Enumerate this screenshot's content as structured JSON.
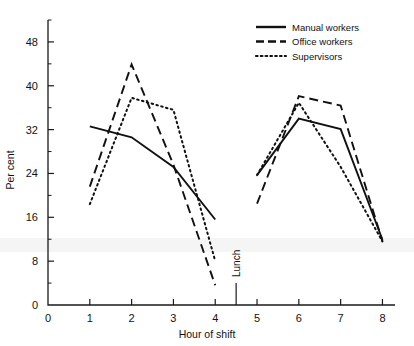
{
  "chart_data": {
    "type": "line",
    "title": "",
    "xlabel": "Hour of shift",
    "ylabel": "Per cent",
    "xlim": [
      0,
      8.3
    ],
    "ylim": [
      0,
      52
    ],
    "grid": false,
    "legend_position": "top-right",
    "x_ticks": [
      "0",
      "1",
      "2",
      "3",
      "4",
      "5",
      "6",
      "7",
      "8"
    ],
    "x_tick_values": [
      0,
      1,
      2,
      3,
      4,
      5,
      6,
      7,
      8
    ],
    "y_ticks": [
      "0",
      "8",
      "16",
      "24",
      "32",
      "40",
      "48"
    ],
    "y_tick_values": [
      0,
      8,
      16,
      24,
      32,
      40,
      48
    ],
    "y_minor_values": [
      4,
      12,
      20,
      28,
      36,
      44,
      52
    ],
    "annotations": [
      {
        "text": "Lunch",
        "x": 4.5,
        "orientation": "vertical",
        "has_tick": true
      }
    ],
    "series": [
      {
        "name": "Manual workers",
        "style": "solid",
        "color": "#111111",
        "segments": [
          {
            "x": [
              1,
              2,
              3,
              4
            ],
            "values": [
              32.6,
              30.6,
              25.2,
              15.6
            ]
          },
          {
            "x": [
              5,
              6,
              7,
              8
            ],
            "values": [
              23.7,
              34.0,
              32.1,
              11.9
            ]
          }
        ]
      },
      {
        "name": "Office workers",
        "style": "dashed",
        "color": "#111111",
        "segments": [
          {
            "x": [
              1,
              2,
              3,
              4
            ],
            "values": [
              21.6,
              43.9,
              25.6,
              3.6
            ]
          },
          {
            "x": [
              5,
              6,
              7,
              8
            ],
            "values": [
              18.5,
              38.1,
              36.4,
              11.6
            ]
          }
        ]
      },
      {
        "name": "Supervisors",
        "style": "dotted",
        "color": "#111111",
        "segments": [
          {
            "x": [
              1,
              2,
              3,
              4
            ],
            "values": [
              18.4,
              37.8,
              35.6,
              8.0
            ]
          },
          {
            "x": [
              5,
              6,
              7,
              8
            ],
            "values": [
              23.7,
              36.9,
              25.2,
              11.6
            ]
          }
        ]
      }
    ]
  },
  "legend": {
    "items": [
      {
        "label": "Manual workers",
        "style": "solid"
      },
      {
        "label": "Office workers",
        "style": "dashed"
      },
      {
        "label": "Supervisors",
        "style": "dotted"
      }
    ]
  },
  "axes": {
    "x_title": "Hour of shift",
    "y_title": "Per cent"
  }
}
